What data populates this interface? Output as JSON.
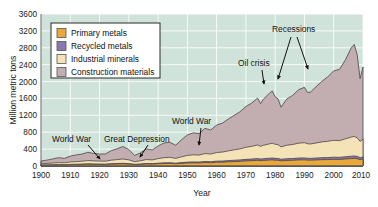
{
  "chart_data": {
    "type": "area",
    "title": "",
    "subtitle": "",
    "xlabel": "Year",
    "ylabel": "Million metric tons",
    "xlim": [
      1900,
      2010
    ],
    "ylim": [
      0,
      3600
    ],
    "xticks": [
      1900,
      1910,
      1920,
      1930,
      1940,
      1950,
      1960,
      1970,
      1980,
      1990,
      2000,
      2010
    ],
    "yticks": [
      0,
      400,
      800,
      1200,
      1600,
      2000,
      2400,
      2800,
      3200,
      3600
    ],
    "grid": true,
    "stacked": true,
    "legend_position": "upper-left-inside",
    "plot_background": "#cfe3da",
    "gridline_color": "#ffffff",
    "x": [
      1900,
      1902,
      1904,
      1906,
      1908,
      1910,
      1912,
      1914,
      1916,
      1918,
      1920,
      1922,
      1924,
      1926,
      1928,
      1930,
      1932,
      1934,
      1936,
      1938,
      1940,
      1942,
      1944,
      1946,
      1948,
      1950,
      1952,
      1954,
      1956,
      1958,
      1960,
      1962,
      1964,
      1966,
      1968,
      1970,
      1972,
      1974,
      1975,
      1976,
      1978,
      1979,
      1980,
      1981,
      1982,
      1984,
      1986,
      1988,
      1990,
      1991,
      1992,
      1994,
      1996,
      1998,
      2000,
      2002,
      2004,
      2006,
      2007,
      2008,
      2009,
      2010
    ],
    "series": [
      {
        "name": "Primary metals",
        "color": "#e8a83a",
        "values": [
          18,
          20,
          23,
          26,
          25,
          30,
          33,
          36,
          40,
          38,
          36,
          35,
          42,
          46,
          50,
          44,
          32,
          38,
          46,
          44,
          52,
          58,
          60,
          52,
          62,
          70,
          74,
          72,
          82,
          78,
          88,
          90,
          98,
          104,
          110,
          120,
          126,
          134,
          126,
          132,
          140,
          144,
          138,
          136,
          122,
          132,
          136,
          144,
          146,
          140,
          138,
          144,
          150,
          152,
          158,
          156,
          166,
          176,
          180,
          174,
          150,
          164
        ]
      },
      {
        "name": "Recycled metals",
        "color": "#8878ae",
        "values": [
          4,
          5,
          6,
          7,
          6,
          8,
          9,
          10,
          12,
          11,
          10,
          10,
          12,
          13,
          14,
          12,
          8,
          10,
          13,
          12,
          15,
          17,
          18,
          16,
          19,
          22,
          23,
          22,
          25,
          24,
          27,
          28,
          30,
          32,
          34,
          37,
          39,
          42,
          39,
          41,
          44,
          45,
          43,
          42,
          38,
          41,
          42,
          45,
          46,
          44,
          43,
          45,
          47,
          48,
          50,
          49,
          53,
          56,
          57,
          55,
          47,
          52
        ]
      },
      {
        "name": "Industrial minerals",
        "color": "#f5e3b8",
        "values": [
          32,
          36,
          42,
          48,
          46,
          56,
          62,
          68,
          76,
          72,
          70,
          68,
          84,
          92,
          102,
          90,
          62,
          76,
          94,
          88,
          108,
          122,
          128,
          112,
          136,
          158,
          168,
          164,
          188,
          180,
          204,
          212,
          230,
          246,
          262,
          286,
          300,
          322,
          300,
          318,
          340,
          350,
          334,
          326,
          292,
          320,
          332,
          352,
          360,
          344,
          340,
          356,
          374,
          386,
          400,
          396,
          424,
          452,
          462,
          442,
          384,
          420
        ]
      },
      {
        "name": "Construction materials",
        "color": "#c2aeb0",
        "values": [
          64,
          78,
          96,
          116,
          104,
          140,
          158,
          168,
          196,
          176,
          168,
          172,
          226,
          256,
          296,
          242,
          148,
          188,
          252,
          236,
          300,
          348,
          356,
          312,
          404,
          486,
          520,
          510,
          596,
          572,
          652,
          686,
          756,
          818,
          880,
          966,
          1026,
          1112,
          1012,
          1094,
          1196,
          1240,
          1124,
          1084,
          940,
          1096,
          1164,
          1266,
          1312,
          1218,
          1226,
          1336,
          1436,
          1530,
          1642,
          1690,
          1872,
          2118,
          2180,
          1968,
          1490,
          1710
        ]
      }
    ],
    "annotations": [
      {
        "text": "World War",
        "x_px": 57,
        "y_px": 142,
        "arrow_from_px": [
          90,
          145
        ],
        "arrow_to_px": [
          100,
          160
        ]
      },
      {
        "text": "Great Depression",
        "x_px": 109,
        "y_px": 142,
        "arrow_from_px": [
          146,
          145
        ],
        "arrow_to_px": [
          139,
          160
        ]
      },
      {
        "text": "World War",
        "x_px": 177,
        "y_px": 124,
        "arrow_from_px": [
          200,
          128
        ],
        "arrow_to_px": [
          198,
          146
        ]
      },
      {
        "text": "Oil crisis",
        "x_px": 243,
        "y_px": 66,
        "arrow_from_px": [
          261,
          70
        ],
        "arrow_to_px": [
          262,
          85
        ]
      },
      {
        "text": "Recessions",
        "x_px": 280,
        "y_px": 32,
        "arrow_from_px": [
          290,
          38
        ],
        "arrow_to_px": [
          283,
          80
        ]
      },
      {
        "text": "",
        "x_px": 0,
        "y_px": 0,
        "arrow_from_px": [
          300,
          38
        ],
        "arrow_to_px": [
          307,
          72
        ]
      }
    ]
  },
  "legend": {
    "items": [
      {
        "label": "Primary metals",
        "color": "#e8a83a"
      },
      {
        "label": "Recycled metals",
        "color": "#8878ae"
      },
      {
        "label": "Industrial minerals",
        "color": "#f5e3b8"
      },
      {
        "label": "Construction materials",
        "color": "#c2aeb0"
      }
    ]
  },
  "axes": {
    "y_title": "Million metric tons",
    "x_title": "Year",
    "y_tick_labels": [
      "3600",
      "3200",
      "2800",
      "2400",
      "2000",
      "1600",
      "1200",
      "800",
      "400",
      "0"
    ],
    "x_tick_labels": [
      "1900",
      "1910",
      "1920",
      "1930",
      "1940",
      "1950",
      "1960",
      "1970",
      "1980",
      "1990",
      "2000",
      "2010"
    ]
  },
  "annotation_labels": {
    "world_war_1": "World War",
    "great_depression": "Great Depression",
    "world_war_2": "World War",
    "oil_crisis": "Oil crisis",
    "recessions": "Recessions"
  }
}
